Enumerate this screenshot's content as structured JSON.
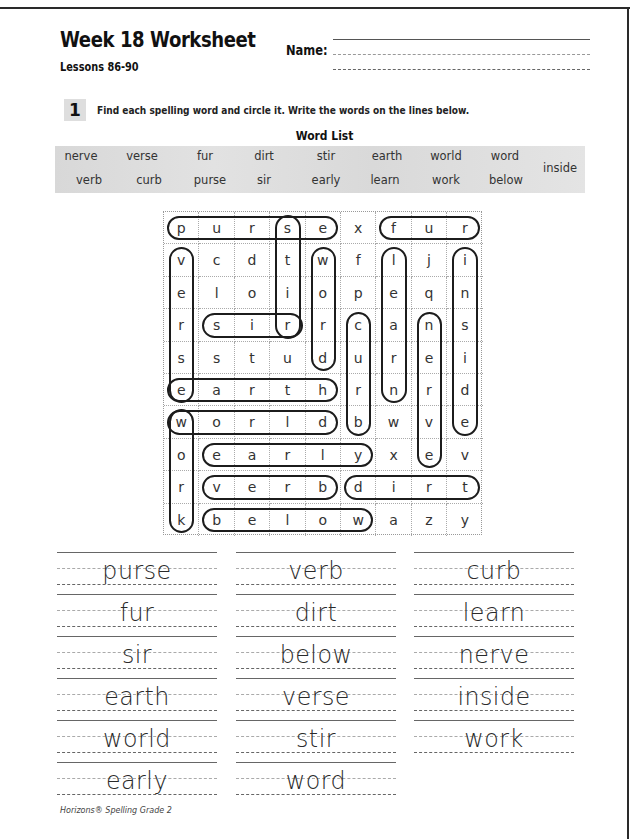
{
  "header": {
    "title": "Week 18 Worksheet",
    "subtitle": "Lessons 86-90",
    "name_label": "Name:",
    "name_value": ""
  },
  "exercise": {
    "number": "1",
    "instructions": "Find each spelling word and circle it. Write the words on the lines below."
  },
  "word_list": {
    "title": "Word List",
    "row1": [
      "nerve",
      "verse",
      "fur",
      "dirt",
      "stir",
      "earth",
      "world",
      "word"
    ],
    "row2": [
      "verb",
      "curb",
      "purse",
      "sir",
      "early",
      "learn",
      "work",
      "below"
    ],
    "extra": "inside"
  },
  "puzzle": {
    "rows": [
      [
        "p",
        "u",
        "r",
        "s",
        "e",
        "x",
        "f",
        "u",
        "r"
      ],
      [
        "v",
        "c",
        "d",
        "t",
        "w",
        "f",
        "l",
        "j",
        "i"
      ],
      [
        "e",
        "l",
        "o",
        "i",
        "o",
        "p",
        "e",
        "q",
        "n"
      ],
      [
        "r",
        "s",
        "i",
        "r",
        "r",
        "c",
        "a",
        "n",
        "s"
      ],
      [
        "s",
        "s",
        "t",
        "u",
        "d",
        "u",
        "r",
        "e",
        "i"
      ],
      [
        "e",
        "a",
        "r",
        "t",
        "h",
        "r",
        "n",
        "r",
        "d"
      ],
      [
        "w",
        "o",
        "r",
        "l",
        "d",
        "b",
        "w",
        "v",
        "e"
      ],
      [
        "o",
        "e",
        "a",
        "r",
        "l",
        "y",
        "x",
        "e",
        "v"
      ],
      [
        "r",
        "v",
        "e",
        "r",
        "b",
        "d",
        "i",
        "r",
        "t"
      ],
      [
        "k",
        "b",
        "e",
        "l",
        "o",
        "w",
        "a",
        "z",
        "y"
      ]
    ],
    "circled": [
      {
        "word": "purse",
        "dir": "h",
        "row": 0,
        "start": 0,
        "end": 4
      },
      {
        "word": "fur",
        "dir": "h",
        "row": 0,
        "start": 6,
        "end": 8
      },
      {
        "word": "stir",
        "dir": "v",
        "col": 3,
        "start": 0,
        "end": 3
      },
      {
        "word": "sir",
        "dir": "h",
        "row": 3,
        "start": 1,
        "end": 3
      },
      {
        "word": "word",
        "dir": "v",
        "col": 4,
        "start": 1,
        "end": 4
      },
      {
        "word": "learn",
        "dir": "v",
        "col": 6,
        "start": 1,
        "end": 5
      },
      {
        "word": "inside",
        "dir": "v",
        "col": 8,
        "start": 1,
        "end": 6
      },
      {
        "word": "curb",
        "dir": "v",
        "col": 5,
        "start": 3,
        "end": 6
      },
      {
        "word": "nerve",
        "dir": "v",
        "col": 7,
        "start": 3,
        "end": 7
      },
      {
        "word": "verse",
        "dir": "v",
        "col": 0,
        "start": 1,
        "end": 5
      },
      {
        "word": "earth",
        "dir": "h",
        "row": 5,
        "start": 0,
        "end": 4
      },
      {
        "word": "world",
        "dir": "h",
        "row": 6,
        "start": 0,
        "end": 4
      },
      {
        "word": "work",
        "dir": "v",
        "col": 0,
        "start": 6,
        "end": 9
      },
      {
        "word": "early",
        "dir": "h",
        "row": 7,
        "start": 1,
        "end": 5
      },
      {
        "word": "verb",
        "dir": "h",
        "row": 8,
        "start": 1,
        "end": 4
      },
      {
        "word": "dirt",
        "dir": "h",
        "row": 8,
        "start": 5,
        "end": 8
      },
      {
        "word": "below",
        "dir": "h",
        "row": 9,
        "start": 1,
        "end": 5
      }
    ]
  },
  "answers": {
    "col1": [
      "purse",
      "fur",
      "sir",
      "earth",
      "world",
      "early"
    ],
    "col2": [
      "verb",
      "dirt",
      "below",
      "verse",
      "stir",
      "word"
    ],
    "col3": [
      "curb",
      "learn",
      "nerve",
      "inside",
      "work"
    ]
  },
  "footer": "Horizons® Spelling Grade 2"
}
